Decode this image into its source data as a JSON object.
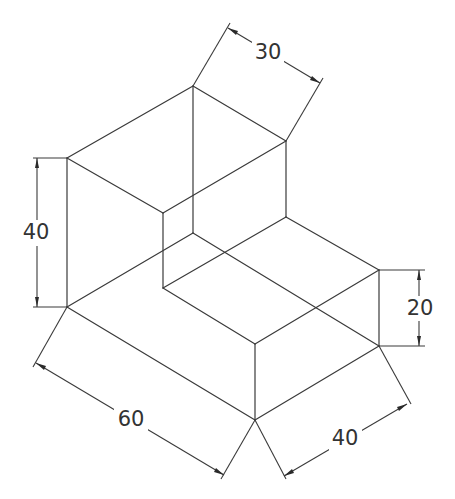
{
  "drawing": {
    "type": "isometric-view",
    "line_color": "#3a3a3a",
    "text_color": "#333333",
    "background": "#ffffff"
  },
  "dimensions": {
    "top_depth": {
      "label": "30",
      "x": 268,
      "y": 52
    },
    "left_height": {
      "label": "40",
      "x": 36,
      "y": 232
    },
    "step_height": {
      "label": "20",
      "x": 420,
      "y": 308
    },
    "front_length": {
      "label": "60",
      "x": 131,
      "y": 419
    },
    "front_width": {
      "label": "40",
      "x": 345,
      "y": 438
    }
  }
}
